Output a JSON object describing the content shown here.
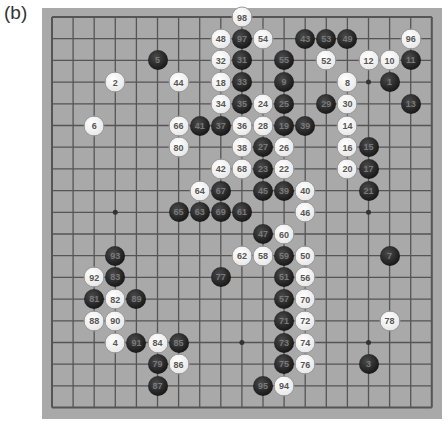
{
  "figure_label": "(b)",
  "board": {
    "size": 19,
    "colors": {
      "board": "#a9a9a9",
      "grid": "#555555",
      "black": "#1b1b1b",
      "white": "#ffffff"
    },
    "star_points": [
      [
        3,
        3
      ],
      [
        3,
        9
      ],
      [
        3,
        15
      ],
      [
        9,
        3
      ],
      [
        9,
        9
      ],
      [
        9,
        15
      ],
      [
        15,
        3
      ],
      [
        15,
        9
      ],
      [
        15,
        15
      ]
    ],
    "stones": [
      {
        "n": "98",
        "c": "white",
        "col": 9,
        "row": 0
      },
      {
        "n": "48",
        "c": "white",
        "col": 8,
        "row": 1
      },
      {
        "n": "97",
        "c": "black",
        "col": 9,
        "row": 1
      },
      {
        "n": "54",
        "c": "white",
        "col": 10,
        "row": 1
      },
      {
        "n": "43",
        "c": "black",
        "col": 12,
        "row": 1
      },
      {
        "n": "53",
        "c": "black",
        "col": 13,
        "row": 1
      },
      {
        "n": "49",
        "c": "black",
        "col": 14,
        "row": 1
      },
      {
        "n": "96",
        "c": "white",
        "col": 17,
        "row": 1
      },
      {
        "n": "5",
        "c": "black",
        "col": 5,
        "row": 2
      },
      {
        "n": "32",
        "c": "white",
        "col": 8,
        "row": 2
      },
      {
        "n": "31",
        "c": "black",
        "col": 9,
        "row": 2
      },
      {
        "n": "55",
        "c": "black",
        "col": 11,
        "row": 2
      },
      {
        "n": "52",
        "c": "white",
        "col": 13,
        "row": 2
      },
      {
        "n": "12",
        "c": "white",
        "col": 15,
        "row": 2
      },
      {
        "n": "10",
        "c": "white",
        "col": 16,
        "row": 2
      },
      {
        "n": "11",
        "c": "black",
        "col": 17,
        "row": 2
      },
      {
        "n": "2",
        "c": "white",
        "col": 3,
        "row": 3
      },
      {
        "n": "44",
        "c": "white",
        "col": 6,
        "row": 3
      },
      {
        "n": "18",
        "c": "white",
        "col": 8,
        "row": 3
      },
      {
        "n": "33",
        "c": "black",
        "col": 9,
        "row": 3
      },
      {
        "n": "9",
        "c": "black",
        "col": 11,
        "row": 3
      },
      {
        "n": "8",
        "c": "white",
        "col": 14,
        "row": 3
      },
      {
        "n": "1",
        "c": "black",
        "col": 16,
        "row": 3
      },
      {
        "n": "34",
        "c": "white",
        "col": 8,
        "row": 4
      },
      {
        "n": "35",
        "c": "black",
        "col": 9,
        "row": 4
      },
      {
        "n": "24",
        "c": "white",
        "col": 10,
        "row": 4
      },
      {
        "n": "25",
        "c": "black",
        "col": 11,
        "row": 4
      },
      {
        "n": "29",
        "c": "black",
        "col": 13,
        "row": 4
      },
      {
        "n": "30",
        "c": "white",
        "col": 14,
        "row": 4
      },
      {
        "n": "13",
        "c": "black",
        "col": 17,
        "row": 4
      },
      {
        "n": "6",
        "c": "white",
        "col": 2,
        "row": 5
      },
      {
        "n": "66",
        "c": "white",
        "col": 6,
        "row": 5
      },
      {
        "n": "41",
        "c": "black",
        "col": 7,
        "row": 5
      },
      {
        "n": "37",
        "c": "black",
        "col": 8,
        "row": 5
      },
      {
        "n": "36",
        "c": "white",
        "col": 9,
        "row": 5
      },
      {
        "n": "28",
        "c": "white",
        "col": 10,
        "row": 5
      },
      {
        "n": "19",
        "c": "black",
        "col": 11,
        "row": 5
      },
      {
        "n": "39",
        "c": "black",
        "col": 12,
        "row": 5
      },
      {
        "n": "14",
        "c": "white",
        "col": 14,
        "row": 5
      },
      {
        "n": "80",
        "c": "white",
        "col": 6,
        "row": 6
      },
      {
        "n": "38",
        "c": "white",
        "col": 9,
        "row": 6
      },
      {
        "n": "27",
        "c": "black",
        "col": 10,
        "row": 6
      },
      {
        "n": "26",
        "c": "white",
        "col": 11,
        "row": 6
      },
      {
        "n": "16",
        "c": "white",
        "col": 14,
        "row": 6
      },
      {
        "n": "15",
        "c": "black",
        "col": 15,
        "row": 6
      },
      {
        "n": "42",
        "c": "white",
        "col": 8,
        "row": 7
      },
      {
        "n": "68",
        "c": "white",
        "col": 9,
        "row": 7
      },
      {
        "n": "23",
        "c": "black",
        "col": 10,
        "row": 7
      },
      {
        "n": "22",
        "c": "white",
        "col": 11,
        "row": 7
      },
      {
        "n": "20",
        "c": "white",
        "col": 14,
        "row": 7
      },
      {
        "n": "17",
        "c": "black",
        "col": 15,
        "row": 7
      },
      {
        "n": "64",
        "c": "white",
        "col": 7,
        "row": 8
      },
      {
        "n": "67",
        "c": "black",
        "col": 8,
        "row": 8
      },
      {
        "n": "45",
        "c": "black",
        "col": 10,
        "row": 8
      },
      {
        "n": "39",
        "c": "black",
        "col": 11,
        "row": 8
      },
      {
        "n": "40",
        "c": "white",
        "col": 12,
        "row": 8
      },
      {
        "n": "21",
        "c": "black",
        "col": 15,
        "row": 8
      },
      {
        "n": "65",
        "c": "black",
        "col": 6,
        "row": 9
      },
      {
        "n": "63",
        "c": "black",
        "col": 7,
        "row": 9
      },
      {
        "n": "69",
        "c": "black",
        "col": 8,
        "row": 9
      },
      {
        "n": "61",
        "c": "black",
        "col": 9,
        "row": 9
      },
      {
        "n": "46",
        "c": "white",
        "col": 12,
        "row": 9
      },
      {
        "n": "47",
        "c": "black",
        "col": 10,
        "row": 10
      },
      {
        "n": "60",
        "c": "white",
        "col": 11,
        "row": 10
      },
      {
        "n": "93",
        "c": "black",
        "col": 3,
        "row": 11
      },
      {
        "n": "62",
        "c": "white",
        "col": 9,
        "row": 11
      },
      {
        "n": "58",
        "c": "white",
        "col": 10,
        "row": 11
      },
      {
        "n": "59",
        "c": "black",
        "col": 11,
        "row": 11
      },
      {
        "n": "50",
        "c": "white",
        "col": 12,
        "row": 11
      },
      {
        "n": "7",
        "c": "black",
        "col": 16,
        "row": 11
      },
      {
        "n": "92",
        "c": "white",
        "col": 2,
        "row": 12
      },
      {
        "n": "83",
        "c": "black",
        "col": 3,
        "row": 12
      },
      {
        "n": "77",
        "c": "black",
        "col": 8,
        "row": 12
      },
      {
        "n": "51",
        "c": "black",
        "col": 11,
        "row": 12
      },
      {
        "n": "56",
        "c": "white",
        "col": 12,
        "row": 12
      },
      {
        "n": "81",
        "c": "black",
        "col": 2,
        "row": 13
      },
      {
        "n": "82",
        "c": "white",
        "col": 3,
        "row": 13
      },
      {
        "n": "89",
        "c": "black",
        "col": 4,
        "row": 13
      },
      {
        "n": "57",
        "c": "black",
        "col": 11,
        "row": 13
      },
      {
        "n": "70",
        "c": "white",
        "col": 12,
        "row": 13
      },
      {
        "n": "88",
        "c": "white",
        "col": 2,
        "row": 14
      },
      {
        "n": "90",
        "c": "white",
        "col": 3,
        "row": 14
      },
      {
        "n": "71",
        "c": "black",
        "col": 11,
        "row": 14
      },
      {
        "n": "72",
        "c": "white",
        "col": 12,
        "row": 14
      },
      {
        "n": "78",
        "c": "white",
        "col": 16,
        "row": 14
      },
      {
        "n": "4",
        "c": "white",
        "col": 3,
        "row": 15
      },
      {
        "n": "91",
        "c": "black",
        "col": 4,
        "row": 15
      },
      {
        "n": "84",
        "c": "white",
        "col": 5,
        "row": 15
      },
      {
        "n": "85",
        "c": "black",
        "col": 6,
        "row": 15
      },
      {
        "n": "73",
        "c": "black",
        "col": 11,
        "row": 15
      },
      {
        "n": "74",
        "c": "white",
        "col": 12,
        "row": 15
      },
      {
        "n": "79",
        "c": "black",
        "col": 5,
        "row": 16
      },
      {
        "n": "86",
        "c": "white",
        "col": 6,
        "row": 16
      },
      {
        "n": "75",
        "c": "black",
        "col": 11,
        "row": 16
      },
      {
        "n": "76",
        "c": "white",
        "col": 12,
        "row": 16
      },
      {
        "n": "3",
        "c": "black",
        "col": 15,
        "row": 16
      },
      {
        "n": "87",
        "c": "black",
        "col": 5,
        "row": 17
      },
      {
        "n": "95",
        "c": "black",
        "col": 10,
        "row": 17
      },
      {
        "n": "94",
        "c": "white",
        "col": 11,
        "row": 17
      }
    ]
  }
}
